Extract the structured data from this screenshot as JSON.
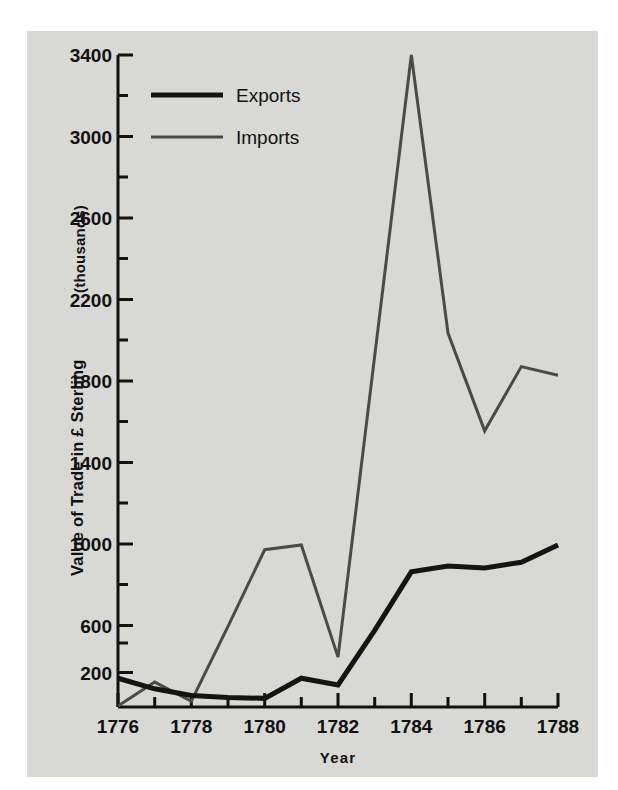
{
  "chart_data": {
    "type": "line",
    "title": "",
    "xlabel": "Year",
    "ylabel": "Value of Trade in £ Sterling (thousands)",
    "ylabel_main": "Value of Trade in £ Sterling",
    "ylabel_suffix": "(thousands)",
    "x": [
      1776,
      1777,
      1778,
      1779,
      1780,
      1781,
      1782,
      1783,
      1784,
      1785,
      1786,
      1787,
      1788
    ],
    "xlim": [
      1776,
      1788
    ],
    "ylim": [
      0,
      3400
    ],
    "yticks": [
      200,
      600,
      1000,
      1400,
      1800,
      2200,
      2600,
      3000,
      3400
    ],
    "ytick_labels": [
      "200",
      "600",
      "1000",
      "1400",
      "1800",
      "2200",
      "2600",
      "3000",
      "3400"
    ],
    "yticks_minor": [
      400,
      800,
      1200,
      1600,
      2000,
      2400,
      2800,
      3200
    ],
    "xticks": [
      1776,
      1777,
      1778,
      1779,
      1780,
      1781,
      1782,
      1783,
      1784,
      1785,
      1786,
      1787,
      1788
    ],
    "xtick_labels": [
      "1776",
      "",
      "1778",
      "",
      "1780",
      "",
      "1782",
      "",
      "1784",
      "",
      "1786",
      "",
      "1788"
    ],
    "xtick_labels_shown": [
      "1776",
      "1778",
      "1780",
      "1782",
      "1784",
      "1786",
      "1788"
    ],
    "grid": false,
    "legend_position": "upper-left",
    "series": [
      {
        "name": "Exports",
        "color": "#141414",
        "line_width": 5,
        "values": [
          150,
          95,
          60,
          50,
          45,
          150,
          115,
          400,
          705,
          735,
          725,
          755,
          845
        ]
      },
      {
        "name": "Imports",
        "color": "#4a4a4a",
        "line_width": 3,
        "values": [
          5,
          130,
          30,
          420,
          820,
          845,
          260,
          1830,
          3400,
          1950,
          1440,
          1775,
          1730
        ]
      }
    ]
  },
  "legend": {
    "items": [
      {
        "label": "Exports",
        "swatch": "thick-black-line"
      },
      {
        "label": "Imports",
        "swatch": "thin-gray-line"
      }
    ]
  },
  "colors": {
    "panel_background": "#d8d8d5",
    "page_background": "#ffffff",
    "axis": "#111111",
    "exports": "#141414",
    "imports": "#4a4a4a"
  }
}
